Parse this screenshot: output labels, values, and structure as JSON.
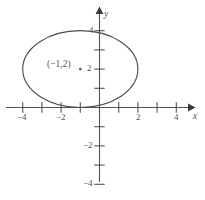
{
  "figure": {
    "background_color": "#ffffff",
    "ink_color": "#55514f",
    "curve_color": "#4f4b49"
  },
  "chart_data": {
    "type": "line",
    "title": "",
    "subtitle": "",
    "xlabel": "x",
    "ylabel": "y",
    "grid": false,
    "legend": false,
    "xlim": [
      -5.2,
      5.0
    ],
    "ylim": [
      -5.0,
      4.8
    ],
    "x_ticks": [
      -4,
      -3,
      -2,
      -1,
      1,
      2,
      3,
      4
    ],
    "y_ticks": [
      1,
      2,
      3,
      4,
      -1,
      -2,
      -3,
      -4
    ],
    "x_tick_labels": [
      "-4",
      "-2",
      "2",
      "4"
    ],
    "y_tick_labels": [
      "4",
      "2",
      "-2",
      "-4"
    ],
    "x_labeled_ticks": [
      -4,
      -2,
      2,
      4
    ],
    "y_labeled_ticks": [
      4,
      2,
      -2,
      -4
    ],
    "curve": {
      "name": "ellipse",
      "shape": "ellipse",
      "center": [
        -1,
        2
      ],
      "semi_axis_x": 3,
      "semi_axis_y": 2,
      "equation": "(x+1)^2/9 + (y-2)^2/4 = 1"
    },
    "annotations": [
      {
        "name": "center-point",
        "label": "(−1,2)",
        "x": -1,
        "y": 2,
        "marker": "dot"
      }
    ]
  },
  "labels": {
    "x_axis_name": "x",
    "y_axis_name": "y",
    "x_neg4": "−4",
    "x_neg2": "−2",
    "x_pos2": "2",
    "x_pos4": "4",
    "y_pos4": "4",
    "y_pos2": "2",
    "y_neg2": "−2",
    "y_neg4": "−4",
    "center_point": "(−1,2)"
  }
}
